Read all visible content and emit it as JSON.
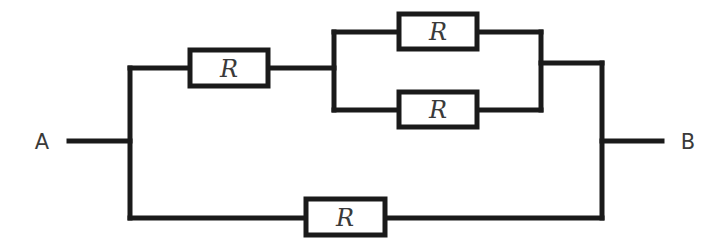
{
  "diagram": {
    "type": "circuit",
    "terminals": {
      "left": "A",
      "right": "B"
    },
    "resistors": [
      {
        "id": "r-series-top",
        "label": "R"
      },
      {
        "id": "r-parallel-upper",
        "label": "R"
      },
      {
        "id": "r-parallel-lower",
        "label": "R"
      },
      {
        "id": "r-bottom",
        "label": "R"
      }
    ],
    "colors": {
      "wire": "#1a1a1a",
      "text": "#3a3a3a",
      "background": "#ffffff"
    }
  }
}
